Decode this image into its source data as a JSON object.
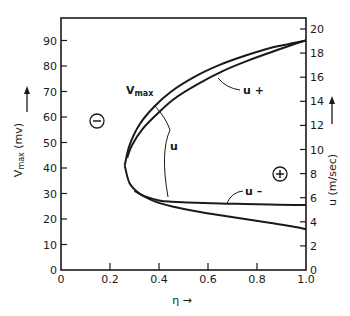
{
  "chart_data": {
    "type": "line",
    "title": "",
    "xlabel": "η →",
    "ylabel": "V_max (mv) →",
    "ylabel_right": "u (m/sec) →",
    "xlim": [
      0,
      1.0
    ],
    "ylim": [
      0,
      100
    ],
    "ylim_right": [
      0,
      20.75
    ],
    "grid": false,
    "x_ticks": [
      "0",
      "0.2",
      "0.4",
      "0.6",
      "0.8",
      "1.0"
    ],
    "y_ticks": [
      "0",
      "10",
      "20",
      "30",
      "40",
      "50",
      "60",
      "70",
      "80",
      "90"
    ],
    "y_ticks_right": [
      "0",
      "2",
      "4",
      "6",
      "8",
      "10",
      "12",
      "14",
      "16",
      "18",
      "20"
    ],
    "series": [
      {
        "name": "V_max (upper branch)",
        "x": [
          0.26,
          0.28,
          0.32,
          0.38,
          0.45,
          0.55,
          0.65,
          0.75,
          0.85,
          0.95,
          1.0
        ],
        "y": [
          41,
          49,
          57,
          64,
          70,
          76,
          80.5,
          84,
          87,
          89,
          90
        ]
      },
      {
        "name": "u+",
        "x": [
          0.27,
          0.29,
          0.33,
          0.39,
          0.46,
          0.56,
          0.66,
          0.76,
          0.86,
          0.95,
          1.0
        ],
        "y": [
          44,
          49,
          55,
          61,
          67,
          73,
          78,
          82,
          85.5,
          88.5,
          90
        ]
      },
      {
        "name": "V_max (lower branch)",
        "x": [
          0.26,
          0.28,
          0.32,
          0.38,
          0.45,
          0.55,
          0.65,
          0.75,
          0.85,
          0.95,
          1.0
        ],
        "y": [
          41,
          34,
          30,
          27,
          25,
          23,
          21.5,
          20,
          18.5,
          17,
          16
        ]
      },
      {
        "name": "u-",
        "x": [
          0.3,
          0.34,
          0.4,
          0.45,
          0.55,
          0.65,
          0.75,
          0.85,
          0.95,
          1.0
        ],
        "y": [
          31,
          29,
          27.3,
          26.8,
          26.4,
          26.1,
          25.9,
          25.7,
          25.5,
          25.5
        ]
      }
    ],
    "annotations": [
      {
        "text": "V_max",
        "x": 0.18,
        "y": 72
      },
      {
        "text": "u+",
        "x": 0.82,
        "y": 73
      },
      {
        "text": "u",
        "x": 0.41,
        "y": 50
      },
      {
        "text": "u-",
        "x": 0.8,
        "y": 31
      },
      {
        "text": "⊖",
        "x": 0.15,
        "y": 60
      },
      {
        "text": "⊕",
        "x": 0.92,
        "y": 38
      }
    ]
  },
  "labels": {
    "xlabel": "η →",
    "ylabel_main": "V",
    "ylabel_sub": "max",
    "ylabel_unit": "(mv)",
    "ylabel_right": "u (m/sec)",
    "anno_vmax_main": "V",
    "anno_vmax_sub": "max",
    "anno_uplus": "u +",
    "anno_u": "u",
    "anno_uminus": "u –",
    "sign_minus": "−",
    "sign_plus": "+"
  }
}
